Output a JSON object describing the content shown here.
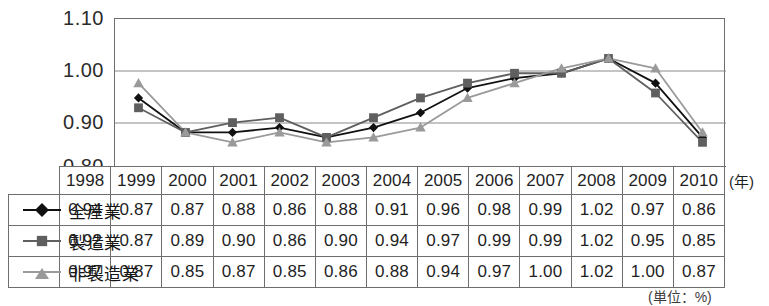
{
  "chart_data": {
    "type": "line",
    "title": "",
    "xlabel": "(年)",
    "ylabel": "",
    "unit_note": "(単位：%)",
    "grid": true,
    "legend_position": "table-left-column",
    "ylim": [
      0.8,
      1.1
    ],
    "yticks": [
      "0.80",
      "0.90",
      "1.00",
      "1.10"
    ],
    "ytick_values": [
      0.8,
      0.9,
      1.0,
      1.1
    ],
    "categories": [
      "1998",
      "1999",
      "2000",
      "2001",
      "2002",
      "2003",
      "2004",
      "2005",
      "2006",
      "2007",
      "2008",
      "2009",
      "2010"
    ],
    "series": [
      {
        "name": "全産業",
        "marker": "diamond",
        "color": "#111111",
        "values": [
          0.94,
          0.87,
          0.87,
          0.88,
          0.86,
          0.88,
          0.91,
          0.96,
          0.98,
          0.99,
          1.02,
          0.97,
          0.86
        ],
        "labels": [
          "0.94",
          "0.87",
          "0.87",
          "0.88",
          "0.86",
          "0.88",
          "0.91",
          "0.96",
          "0.98",
          "0.99",
          "1.02",
          "0.97",
          "0.86"
        ]
      },
      {
        "name": "製造業",
        "marker": "square",
        "color": "#5f5f5f",
        "values": [
          0.92,
          0.87,
          0.89,
          0.9,
          0.86,
          0.9,
          0.94,
          0.97,
          0.99,
          0.99,
          1.02,
          0.95,
          0.85
        ],
        "labels": [
          "0.92",
          "0.87",
          "0.89",
          "0.90",
          "0.86",
          "0.90",
          "0.94",
          "0.97",
          "0.99",
          "0.99",
          "1.02",
          "0.95",
          "0.85"
        ]
      },
      {
        "name": "非製造業",
        "marker": "triangle",
        "color": "#9a9a9a",
        "values": [
          0.97,
          0.87,
          0.85,
          0.87,
          0.85,
          0.86,
          0.88,
          0.94,
          0.97,
          1.0,
          1.02,
          1.0,
          0.87
        ],
        "labels": [
          "0.97",
          "0.87",
          "0.85",
          "0.87",
          "0.85",
          "0.86",
          "0.88",
          "0.94",
          "0.97",
          "1.00",
          "1.02",
          "1.00",
          "0.87"
        ]
      }
    ]
  },
  "table": {
    "corner_label": "",
    "year_header": [
      "1998",
      "1999",
      "2000",
      "2001",
      "2002",
      "2003",
      "2004",
      "2005",
      "2006",
      "2007",
      "2008",
      "2009",
      "2010"
    ],
    "rows": [
      {
        "label": "全産業",
        "marker": "diamond",
        "values": [
          "0.94",
          "0.87",
          "0.87",
          "0.88",
          "0.86",
          "0.88",
          "0.91",
          "0.96",
          "0.98",
          "0.99",
          "1.02",
          "0.97",
          "0.86"
        ]
      },
      {
        "label": "製造業",
        "marker": "square",
        "values": [
          "0.92",
          "0.87",
          "0.89",
          "0.90",
          "0.86",
          "0.90",
          "0.94",
          "0.97",
          "0.99",
          "0.99",
          "1.02",
          "0.95",
          "0.85"
        ]
      },
      {
        "label": "非製造業",
        "marker": "triangle",
        "values": [
          "0.97",
          "0.87",
          "0.85",
          "0.87",
          "0.85",
          "0.86",
          "0.88",
          "0.94",
          "0.97",
          "1.00",
          "1.02",
          "1.00",
          "0.87"
        ]
      }
    ]
  },
  "annotations": {
    "year_axis_label": "(年)",
    "unit_footnote": "(単位：%)"
  }
}
